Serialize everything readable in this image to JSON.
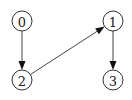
{
  "diagram": {
    "type": "directed-graph",
    "nodes": [
      {
        "id": "0",
        "label": "0",
        "cx": 22,
        "cy": 21
      },
      {
        "id": "1",
        "label": "1",
        "cx": 113,
        "cy": 21
      },
      {
        "id": "2",
        "label": "2",
        "cx": 22,
        "cy": 80
      },
      {
        "id": "3",
        "label": "3",
        "cx": 113,
        "cy": 80
      }
    ],
    "edges": [
      {
        "from": "0",
        "to": "2"
      },
      {
        "from": "2",
        "to": "1"
      },
      {
        "from": "1",
        "to": "3"
      }
    ],
    "node_radius": 10
  }
}
